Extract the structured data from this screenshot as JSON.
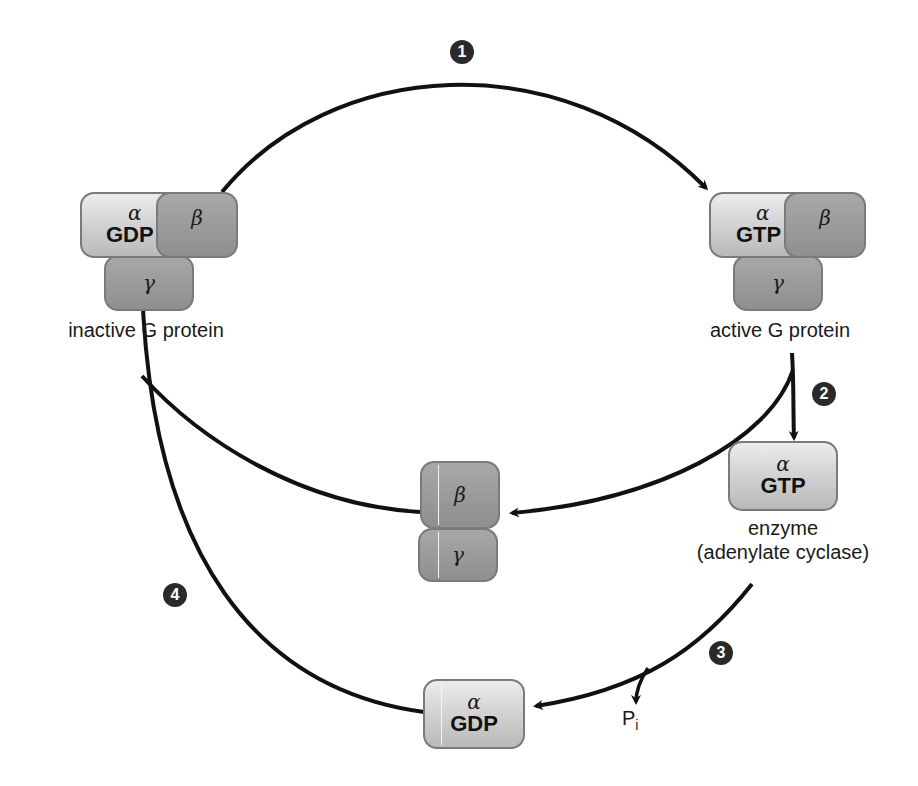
{
  "figure": {
    "type": "G protein activation/inactivation cycle"
  },
  "inactive_g_protein": {
    "alpha_symbol": "α",
    "alpha_nucleotide": "GDP",
    "beta_symbol": "β",
    "gamma_symbol": "γ",
    "label": "inactive G protein"
  },
  "active_g_protein": {
    "alpha_symbol": "α",
    "alpha_nucleotide": "GTP",
    "beta_symbol": "β",
    "gamma_symbol": "γ",
    "label": "active G protein"
  },
  "beta_gamma_dimer": {
    "beta_symbol": "β",
    "gamma_symbol": "γ"
  },
  "alpha_gtp": {
    "alpha_symbol": "α",
    "nucleotide": "GTP",
    "label_line1": "enzyme",
    "label_line2": "(adenylate cyclase)"
  },
  "alpha_gdp": {
    "alpha_symbol": "α",
    "nucleotide": "GDP"
  },
  "phosphate": {
    "label": "P",
    "subscript": "i"
  },
  "steps": [
    {
      "number": "1"
    },
    {
      "number": "2"
    },
    {
      "number": "3"
    },
    {
      "number": "4"
    }
  ],
  "colors": {
    "arrow": "#111111",
    "alpha_fill": "#d4d4d4",
    "beta_gamma_fill": "#999999",
    "step_badge": "#2a2a2a"
  }
}
